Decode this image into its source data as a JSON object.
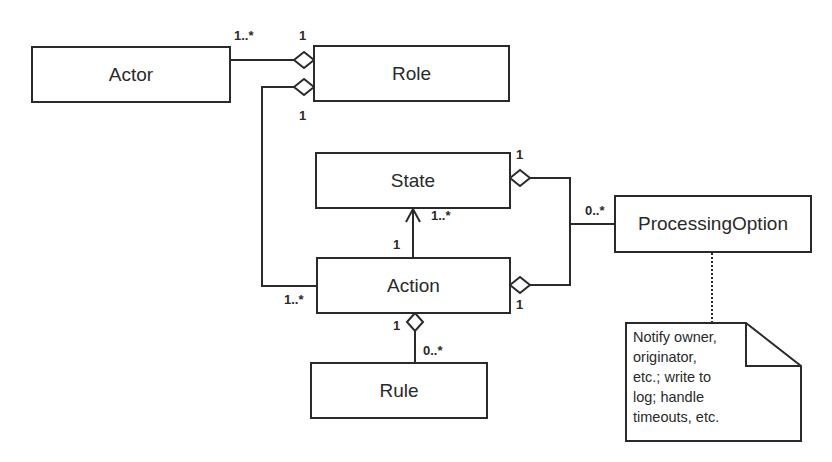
{
  "classes": {
    "actor": "Actor",
    "role": "Role",
    "state": "State",
    "action": "Action",
    "rule": "Rule",
    "processing_option": "ProcessingOption"
  },
  "multiplicities": {
    "actor_role_actor_end": "1..*",
    "actor_role_role_end": "1",
    "role_action_role_end": "1",
    "role_action_action_end": "1..*",
    "state_po_state_end": "1",
    "action_state_state_end": "1..*",
    "action_state_action_end": "1",
    "po_end": "0..*",
    "action_po_action_end": "1",
    "action_rule_action_end": "1",
    "action_rule_rule_end": "0..*"
  },
  "note": {
    "lines": [
      "Notify owner,",
      "originator,",
      "etc.; write to",
      "log; handle",
      "timeouts, etc."
    ]
  },
  "colors": {
    "stroke": "#2a2a2a",
    "background": "#ffffff"
  }
}
